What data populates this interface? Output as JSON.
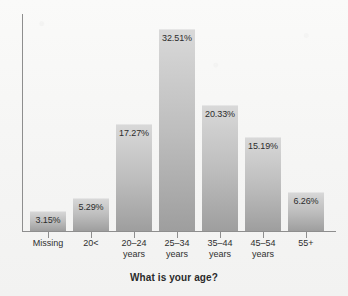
{
  "chart_data": {
    "type": "bar",
    "title": "",
    "xlabel": "What is your age?",
    "ylabel": "",
    "grid": false,
    "legend": false,
    "ylim": [
      0,
      35
    ],
    "categories": [
      "Missing",
      "20<",
      "20–24 years",
      "25–34 years",
      "35–44 years",
      "45–54 years",
      "55+"
    ],
    "category_lines": [
      {
        "line1": "Missing",
        "line2": ""
      },
      {
        "line1": "20<",
        "line2": ""
      },
      {
        "line1": "20–24",
        "line2": "years"
      },
      {
        "line1": "25–34",
        "line2": "years"
      },
      {
        "line1": "35–44",
        "line2": "years"
      },
      {
        "line1": "45–54",
        "line2": "years"
      },
      {
        "line1": "55+",
        "line2": ""
      }
    ],
    "values": [
      3.15,
      5.29,
      17.27,
      32.51,
      20.33,
      15.19,
      6.26
    ],
    "value_labels": [
      "3.15%",
      "5.29%",
      "17.27%",
      "32.51%",
      "20.33%",
      "15.19%",
      "6.26%"
    ],
    "bar_fill_top": "#d9d9d9",
    "bar_fill_bottom": "#9e9e9e",
    "axis_color": "#8e8e8e",
    "label_color": "#2c2c2c",
    "background": "#f7f7f6"
  }
}
